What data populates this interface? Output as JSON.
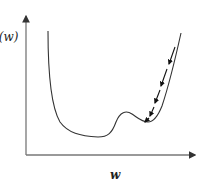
{
  "diagram": {
    "title": "",
    "type": "loss-landscape",
    "y_axis": {
      "label": "J(w)"
    },
    "x_axis": {
      "label": "w"
    },
    "curve": {
      "description": "Loss curve with steep left wall, wide global minimum plateau, a bump, a local minimum, and steep right wall",
      "color": "#333333"
    },
    "descent_path": {
      "description": "Dashed arrow path descending along the right branch into the local minimum",
      "style": "dashed with arrowheads",
      "color": "#111111"
    },
    "colors": {
      "axis": "#666666",
      "curve": "#333333",
      "arrow": "#111111",
      "background": "#ffffff"
    }
  }
}
